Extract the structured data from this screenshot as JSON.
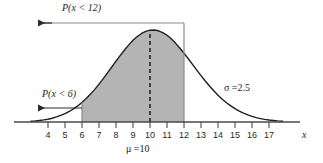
{
  "figure": {
    "colors": {
      "curve": "#1f1f1f",
      "axis": "#4a4a4a",
      "shade_fill": "#b4b4b4",
      "shade_edge": "#8a8a8a",
      "text": "#1c1c1c",
      "background": "#ffffff"
    }
  },
  "labels": {
    "prob_upper": "P(x < 12)",
    "prob_lower": "P(x < 6)",
    "sigma": "σ =2.5",
    "mu": "μ =10",
    "axis_x": "x"
  },
  "chart_data": {
    "type": "line",
    "title": "",
    "subtitle": "",
    "xlabel": "x",
    "ylabel": "",
    "grid": false,
    "legend": null,
    "distribution": {
      "kind": "normal",
      "mean": 10,
      "sigma": 2.5
    },
    "xlim": [
      3.0,
      17.8
    ],
    "ylim": [
      0,
      1.12
    ],
    "xticks": [
      4,
      5,
      6,
      7,
      8,
      9,
      10,
      11,
      12,
      13,
      14,
      15,
      16,
      17
    ],
    "xticklabels": [
      "4",
      "5",
      "6",
      "7",
      "8",
      "9",
      "10",
      "11",
      "12",
      "13",
      "14",
      "15",
      "16",
      "17"
    ],
    "yticks": [],
    "yticklabels": [],
    "annotations": [
      {
        "name": "prob-upper",
        "text": "P(x < 12)",
        "kind": "arrow-left",
        "at_x": 12,
        "value_label": "P(x < 12)"
      },
      {
        "name": "prob-lower",
        "text": "P(x < 6)",
        "kind": "arrow-left",
        "at_x": 6,
        "value_label": "P(x < 6)"
      },
      {
        "name": "sigma",
        "text": "σ =2.5",
        "kind": "text",
        "at_x": 14.6
      },
      {
        "name": "mu",
        "text": "μ =10",
        "kind": "text",
        "at_x": 10
      }
    ],
    "shaded_region": {
      "from": 6,
      "to": 12,
      "fill": "#b4b4b4"
    },
    "vertical_lines": [
      {
        "x": 10,
        "style": "dashed",
        "name": "mean-line"
      },
      {
        "x": 12,
        "style": "solid",
        "name": "boundary-12-line"
      },
      {
        "x": 6,
        "style": "solid",
        "name": "boundary-6-line"
      }
    ],
    "series": [
      {
        "name": "normal-pdf",
        "x": [
          3.0,
          3.25,
          3.5,
          3.75,
          4.0,
          4.25,
          4.5,
          4.75,
          5.0,
          5.25,
          5.5,
          5.75,
          6.0,
          6.25,
          6.5,
          6.75,
          7.0,
          7.25,
          7.5,
          7.75,
          8.0,
          8.25,
          8.5,
          8.75,
          9.0,
          9.25,
          9.5,
          9.75,
          10.0,
          10.25,
          10.5,
          10.75,
          11.0,
          11.25,
          11.5,
          11.75,
          12.0,
          12.25,
          12.5,
          12.75,
          13.0,
          13.25,
          13.5,
          13.75,
          14.0,
          14.25,
          14.5,
          14.75,
          15.0,
          15.25,
          15.5,
          15.75,
          16.0,
          16.25,
          16.5,
          16.75,
          17.0,
          17.25,
          17.5,
          17.8
        ],
        "y": [
          0.007,
          0.01,
          0.015,
          0.021,
          0.028,
          0.038,
          0.051,
          0.066,
          0.084,
          0.106,
          0.132,
          0.162,
          0.198,
          0.237,
          0.281,
          0.329,
          0.382,
          0.437,
          0.495,
          0.554,
          0.613,
          0.671,
          0.726,
          0.777,
          0.823,
          0.861,
          0.892,
          0.913,
          0.925,
          0.927,
          0.919,
          0.901,
          0.874,
          0.838,
          0.795,
          0.746,
          0.693,
          0.637,
          0.58,
          0.523,
          0.467,
          0.413,
          0.362,
          0.314,
          0.27,
          0.23,
          0.194,
          0.162,
          0.134,
          0.11,
          0.089,
          0.071,
          0.056,
          0.044,
          0.034,
          0.026,
          0.02,
          0.015,
          0.011,
          0.008
        ]
      }
    ]
  }
}
